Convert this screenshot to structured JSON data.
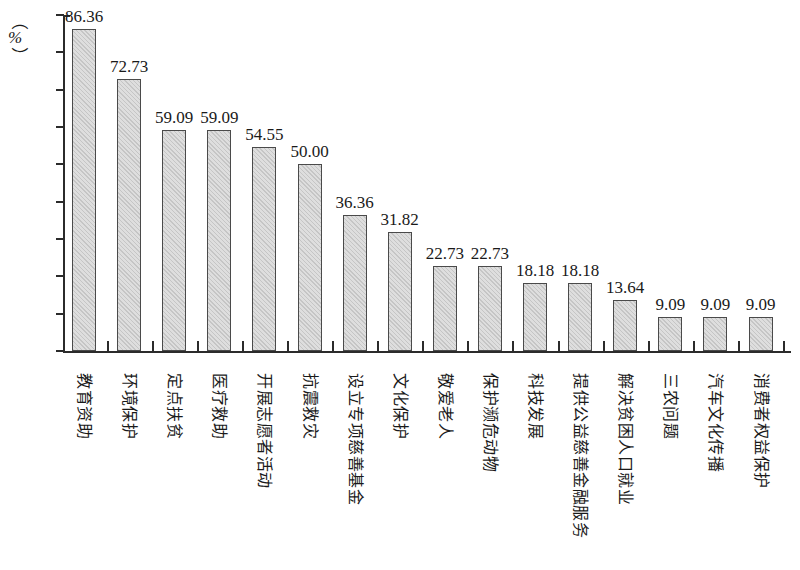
{
  "axis": {
    "y_unit_open_paren": "（",
    "y_unit_symbol": "%",
    "y_unit_close_paren": "）",
    "y_ticks": [
      "90",
      "80",
      "70",
      "60",
      "50",
      "40",
      "30",
      "20",
      "10",
      "0"
    ]
  },
  "chart_data": {
    "type": "bar",
    "title": "",
    "subtitle": "",
    "xlabel": "",
    "ylabel": "%",
    "ylim": [
      0,
      90
    ],
    "ytick_step": 10,
    "grid": false,
    "legend": "none",
    "bar_fill_color": "#dedede",
    "bar_border_color": "#4a4a4a",
    "categories": [
      "教育资助",
      "环境保护",
      "定点扶贫",
      "医疗救助",
      "开展志愿者活动",
      "抗震救灾",
      "设立专项慈善基金",
      "文化保护",
      "敬爱老人",
      "保护濒危动物",
      "科技发展",
      "提供公益慈善金融服务",
      "解决贫困人口就业",
      "三农问题",
      "汽车文化传播",
      "消费者权益保护"
    ],
    "values": [
      86.36,
      72.73,
      59.09,
      59.09,
      54.55,
      50.0,
      36.36,
      31.82,
      22.73,
      22.73,
      18.18,
      18.18,
      13.64,
      9.09,
      9.09,
      9.09
    ],
    "value_labels": [
      "86.36",
      "72.73",
      "59.09",
      "59.09",
      "54.55",
      "50.00",
      "36.36",
      "31.82",
      "22.73",
      "22.73",
      "18.18",
      "18.18",
      "13.64",
      "9.09",
      "9.09",
      "9.09"
    ]
  }
}
